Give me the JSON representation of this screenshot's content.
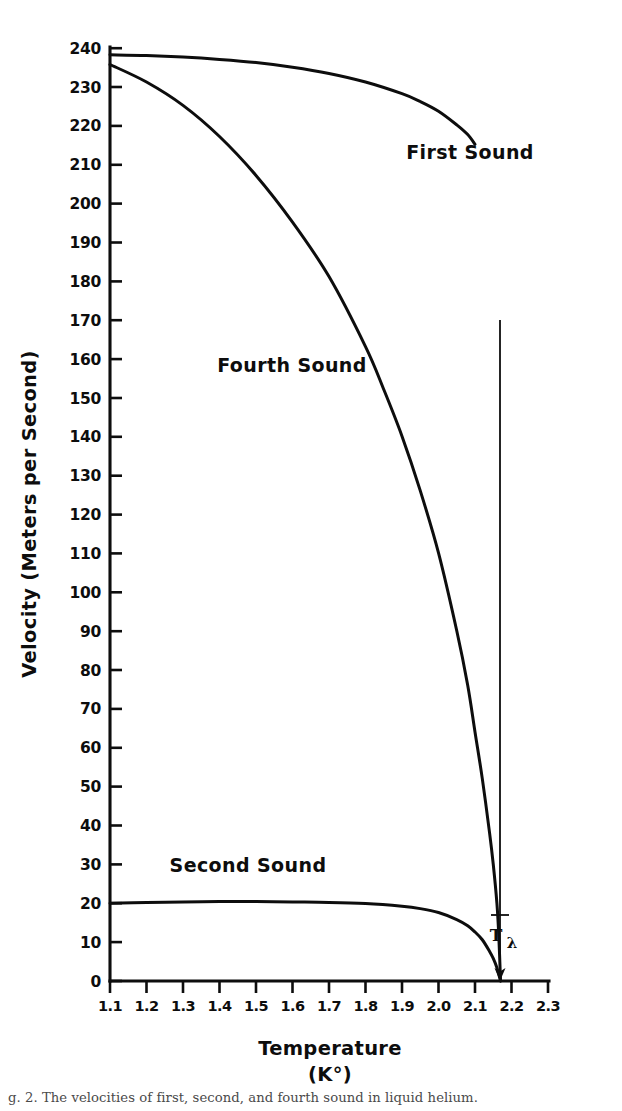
{
  "figure": {
    "caption": "g. 2. The velocities of first, second, and fourth sound in liquid helium."
  },
  "chart_data": {
    "type": "line",
    "title": "",
    "xlabel": "Temperature",
    "xlabel_units": "(K°)",
    "ylabel": "Velocity (Meters per Second)",
    "xlim": [
      1.1,
      2.3
    ],
    "ylim": [
      0,
      240
    ],
    "grid": false,
    "legend_position": "inline-annotations",
    "xticks": [
      1.1,
      1.2,
      1.3,
      1.4,
      1.5,
      1.6,
      1.7,
      1.8,
      1.9,
      2.0,
      2.1,
      2.2,
      2.3
    ],
    "xtick_labels": [
      "1.1",
      "1.2",
      "1.3",
      "1.4",
      "1.5",
      "1.6",
      "1.7",
      "1.8",
      "1.9",
      "2.0",
      "2.1",
      "2.2",
      "2.3"
    ],
    "yticks": [
      0,
      10,
      20,
      30,
      40,
      50,
      60,
      70,
      80,
      90,
      100,
      110,
      120,
      130,
      140,
      150,
      160,
      170,
      180,
      190,
      200,
      210,
      220,
      230,
      240
    ],
    "ytick_labels": [
      "0",
      "10",
      "20",
      "30",
      "40",
      "50",
      "60",
      "70",
      "80",
      "90",
      "100",
      "110",
      "120",
      "130",
      "140",
      "150",
      "160",
      "170",
      "180",
      "190",
      "200",
      "210",
      "220",
      "230",
      "240"
    ],
    "series": [
      {
        "name": "First Sound",
        "label": "First Sound",
        "x": [
          1.1,
          1.2,
          1.3,
          1.4,
          1.5,
          1.6,
          1.7,
          1.8,
          1.9,
          1.95,
          2.0,
          2.05,
          2.08,
          2.1
        ],
        "values": [
          238.0,
          237.8,
          237.4,
          236.8,
          236.0,
          234.8,
          233.2,
          231.0,
          228.0,
          226.0,
          223.5,
          220.0,
          217.5,
          215.0
        ]
      },
      {
        "name": "Fourth Sound",
        "label": "Fourth Sound",
        "x": [
          1.1,
          1.2,
          1.3,
          1.4,
          1.5,
          1.6,
          1.7,
          1.8,
          1.85,
          1.9,
          1.95,
          2.0,
          2.05,
          2.08,
          2.1,
          2.12,
          2.14,
          2.15,
          2.16,
          2.165,
          2.17
        ],
        "values": [
          235.5,
          231.0,
          225.0,
          217.0,
          207.0,
          195.0,
          181.0,
          163.0,
          152.0,
          140.0,
          126.0,
          110.0,
          90.0,
          76.0,
          64.0,
          52.0,
          38.0,
          30.0,
          20.0,
          12.0,
          0.0
        ]
      },
      {
        "name": "Second Sound",
        "label": "Second Sound",
        "x": [
          1.1,
          1.2,
          1.3,
          1.4,
          1.5,
          1.6,
          1.7,
          1.8,
          1.9,
          1.95,
          2.0,
          2.05,
          2.08,
          2.1,
          2.12,
          2.14,
          2.15,
          2.16,
          2.17
        ],
        "values": [
          20.0,
          20.2,
          20.3,
          20.4,
          20.4,
          20.3,
          20.2,
          19.9,
          19.2,
          18.6,
          17.6,
          15.8,
          14.2,
          12.6,
          10.6,
          7.6,
          5.8,
          3.4,
          0.0
        ]
      }
    ],
    "annotations": [
      {
        "name": "lambda-point",
        "text": "T",
        "subscript": "λ",
        "x": 2.17,
        "y": 0,
        "description": "Lambda point marker with downward arrow to the temperature axis"
      }
    ]
  },
  "colors": {
    "ink": "#0d0d0d",
    "background": "#ffffff",
    "caption": "#4a4a4a"
  }
}
